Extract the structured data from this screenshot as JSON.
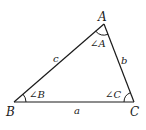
{
  "diagram": {
    "type": "triangle",
    "stroke_color": "#1a1a1a",
    "background": "#ffffff",
    "vertices": [
      {
        "name": "A",
        "label": "A",
        "x": 104,
        "y": 24
      },
      {
        "name": "B",
        "label": "B",
        "x": 14,
        "y": 102
      },
      {
        "name": "C",
        "label": "C",
        "x": 134,
        "y": 102
      }
    ],
    "sides": [
      {
        "name": "a",
        "label": "a",
        "between": [
          "B",
          "C"
        ]
      },
      {
        "name": "b",
        "label": "b",
        "between": [
          "A",
          "C"
        ]
      },
      {
        "name": "c",
        "label": "c",
        "between": [
          "A",
          "B"
        ]
      }
    ],
    "angles": [
      {
        "name": "A",
        "label": "∠A"
      },
      {
        "name": "B",
        "label": "∠B"
      },
      {
        "name": "C",
        "label": "∠C"
      }
    ]
  }
}
